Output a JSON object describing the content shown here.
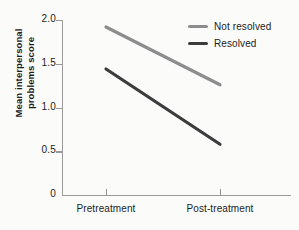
{
  "chart_data": {
    "type": "line",
    "title": "",
    "xlabel": "",
    "ylabel": "Mean interpersonal problems score",
    "categories": [
      "Pretreatment",
      "Post-treatment"
    ],
    "ylim": [
      0,
      2.0
    ],
    "yticks": [
      "0",
      "0.5",
      "1.0",
      "1.5",
      "2.0"
    ],
    "ytick_values": [
      0,
      0.5,
      1.0,
      1.5,
      2.0
    ],
    "grid": false,
    "legend_position": "top-right",
    "series": [
      {
        "name": "Not resolved",
        "color": "#8d8d8d",
        "values": [
          1.92,
          1.26
        ]
      },
      {
        "name": "Resolved",
        "color": "#3c3c3c",
        "values": [
          1.44,
          0.58
        ]
      }
    ]
  },
  "axis": {
    "ylabel_line1": "Mean interpersonal",
    "ylabel_line2": "problems score"
  },
  "legend": {
    "items": [
      {
        "label": "Not resolved"
      },
      {
        "label": "Resolved"
      }
    ]
  },
  "colors": {
    "not_resolved": "#8d8d8d",
    "resolved": "#3c3c3c",
    "axis": "#9a9a9a",
    "text": "#1c1c1c",
    "background": "#fbfbfa"
  }
}
